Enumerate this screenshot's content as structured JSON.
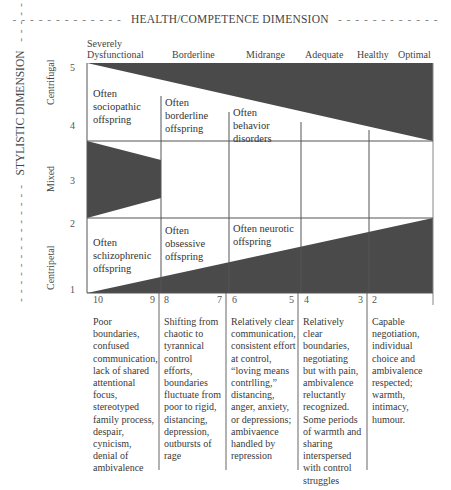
{
  "title": {
    "text": "HEALTH/COMPETENCE DIMENSION",
    "dashes_left": "- - - - - - - - - - - - -",
    "dashes_right": "- - - - - - - - - - - -"
  },
  "side_title": {
    "text": "STYLISTIC DIMENSION",
    "dashes_top": "- - - - - - - - - - - - - -",
    "dashes_bottom": "- - - - - - - - - - - - - -"
  },
  "health_levels": [
    {
      "line1": "Severely",
      "line2": "Dysfunctional"
    },
    {
      "line1": "",
      "line2": "Borderline"
    },
    {
      "line1": "",
      "line2": "Midrange"
    },
    {
      "line1": "",
      "line2": "Adequate"
    },
    {
      "line1": "",
      "line2": "Healthy"
    },
    {
      "line1": "",
      "line2": "Optimal"
    }
  ],
  "style_levels": {
    "ticks": [
      "5",
      "4",
      "3",
      "2",
      "1"
    ],
    "bands": [
      "Centrifugal",
      "Mixed",
      "Centripetal"
    ]
  },
  "cells": {
    "sociopathic": [
      "Often",
      "sociopathic",
      "offspring"
    ],
    "borderline": [
      "Often",
      "borderline",
      "offspring"
    ],
    "behavior": [
      "Often",
      "behavior",
      "disorders"
    ],
    "schizophrenic": [
      "Often",
      "schizophrenic",
      "offspring"
    ],
    "obsessive": [
      "Often",
      "obsessive",
      "offspring"
    ],
    "neurotic": [
      "Often neurotic",
      "offspring"
    ]
  },
  "x_ticks": {
    "col1_left": "10",
    "col1_right": "9",
    "col2_left": "8",
    "col2_right": "7",
    "col3_left": "6",
    "col3_right": "5",
    "col4_left": "4",
    "col4_right": "3",
    "col5_left": "2"
  },
  "descriptions": [
    [
      "Poor",
      "boundaries,",
      "confused",
      "communication,",
      "lack of shared",
      "attentional",
      "focus,",
      "stereotyped",
      "family process,",
      "despair,",
      "cynicism,",
      "denial of",
      "ambivalence"
    ],
    [
      "Shifting from",
      "chaotic to",
      "tyrannical",
      "control",
      "efforts,",
      "boundaries",
      "fluctuate from",
      "poor to rigid,",
      "distancing,",
      "depression,",
      "outbursts of",
      "rage"
    ],
    [
      "Relatively clear",
      "communication,",
      "consistent effort",
      "at control,",
      "“loving means",
      "contrlling,”",
      "distancing,",
      "anger, anxiety,",
      "or depressions;",
      "ambivaence",
      "handled by",
      "repression"
    ],
    [
      "Relatively",
      "clear",
      "boundaries,",
      "negotiating",
      "but with pain,",
      "ambivalence",
      "reluctantly",
      "recognized.",
      "Some periods",
      "of warmth and",
      "sharing",
      "interspersed",
      "with control",
      "struggles"
    ],
    [
      "Capable",
      "negotiation,",
      "individual",
      "choice and",
      "ambivalence",
      "respected;",
      "warmth,",
      "intimacy,",
      "humour."
    ]
  ],
  "colors": {
    "wedge": "#4a4a4a",
    "grid": "#555555",
    "text": "#3a3a3a"
  }
}
